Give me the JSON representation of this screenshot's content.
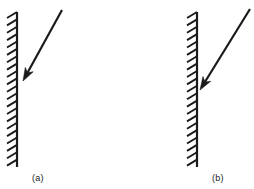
{
  "figure": {
    "background_color": "#ffffff",
    "ink_color": "#1a1a1a",
    "width": 254,
    "height": 189
  },
  "panels": [
    {
      "id": "a",
      "label": "(a)",
      "label_x": 32,
      "label_y": 173,
      "wall": {
        "name": "hatched-wall-line",
        "x": 17,
        "y_top": 12,
        "y_bottom": 167,
        "stroke_width": 2.2,
        "hatch_side": "left",
        "hatch_count": 22,
        "hatch_length": 11,
        "hatch_dx": -10,
        "hatch_dy": 6,
        "hatch_stroke_width": 1.9
      },
      "arrow": {
        "name": "incident-ray-arrow",
        "x1": 62,
        "y1": 10,
        "x2": 23,
        "y2": 81,
        "stroke_width": 2.2,
        "head_length": 13,
        "head_width": 9,
        "tip_touches_wall": false,
        "description": "oblique arrow pointing down-left toward the wall, stopping short of it"
      }
    },
    {
      "id": "b",
      "label": "(b)",
      "label_x": 212,
      "label_y": 173,
      "wall": {
        "name": "hatched-wall-line",
        "x": 197,
        "y_top": 12,
        "y_bottom": 167,
        "stroke_width": 2.2,
        "hatch_side": "left",
        "hatch_count": 22,
        "hatch_length": 11,
        "hatch_dx": -10,
        "hatch_dy": 6,
        "hatch_stroke_width": 1.9
      },
      "arrow": {
        "name": "incident-ray-arrow",
        "x1": 250,
        "y1": 9,
        "x2": 200,
        "y2": 90,
        "stroke_width": 2.2,
        "head_length": 13,
        "head_width": 9,
        "tip_touches_wall": true,
        "description": "oblique arrow at about 45 degrees pointing down-left, tip landing on the wall"
      }
    }
  ]
}
